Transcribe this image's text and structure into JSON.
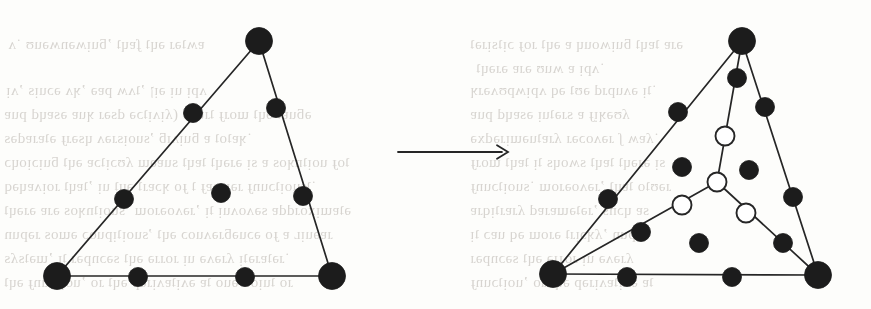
{
  "figure": {
    "caption": "",
    "background_color": "#fdfdfb",
    "ink_color": "#1c1c1c",
    "hollow_fill_color": "#ffffff",
    "stroke_color": "#262626",
    "transition_symbol": "arrow-right",
    "panels": [
      {
        "id": "left-panel",
        "name": "original-triangle",
        "label": "",
        "triangle": {
          "vertices": [
            {
              "name": "apex",
              "x": 259,
              "y": 41,
              "r": 13.5,
              "style": "filled"
            },
            {
              "name": "bottom-left",
              "x": 57,
              "y": 276,
              "r": 13.5,
              "style": "filled"
            },
            {
              "name": "bottom-right",
              "x": 332,
              "y": 276,
              "r": 13.5,
              "style": "filled"
            }
          ],
          "edges": [
            {
              "from": "apex",
              "to": "bottom-left"
            },
            {
              "from": "apex",
              "to": "bottom-right"
            },
            {
              "from": "bottom-left",
              "to": "bottom-right"
            }
          ]
        },
        "control_points": [
          {
            "name": "left-edge-upper",
            "x": 193,
            "y": 113,
            "r": 9.5,
            "style": "filled"
          },
          {
            "name": "left-edge-lower",
            "x": 124,
            "y": 199,
            "r": 9.5,
            "style": "filled"
          },
          {
            "name": "right-edge-upper",
            "x": 276,
            "y": 108,
            "r": 9.5,
            "style": "filled"
          },
          {
            "name": "right-edge-lower",
            "x": 303,
            "y": 196,
            "r": 9.5,
            "style": "filled"
          },
          {
            "name": "bottom-edge-left",
            "x": 138,
            "y": 277,
            "r": 9.5,
            "style": "filled"
          },
          {
            "name": "bottom-edge-right",
            "x": 245,
            "y": 277,
            "r": 9.5,
            "style": "filled"
          },
          {
            "name": "interior-center",
            "x": 221,
            "y": 193,
            "r": 9.5,
            "style": "filled"
          }
        ]
      },
      {
        "id": "right-panel",
        "name": "subdivided-triangle",
        "label": "",
        "triangle": {
          "vertices": [
            {
              "name": "apex",
              "x": 742,
              "y": 41,
              "r": 13.5,
              "style": "filled"
            },
            {
              "name": "bottom-left",
              "x": 553,
              "y": 274,
              "r": 13.5,
              "style": "filled"
            },
            {
              "name": "bottom-right",
              "x": 818,
              "y": 275,
              "r": 13.5,
              "style": "filled"
            }
          ],
          "edges": [
            {
              "from": "apex",
              "to": "bottom-left"
            },
            {
              "from": "apex",
              "to": "bottom-right"
            },
            {
              "from": "bottom-left",
              "to": "bottom-right"
            }
          ]
        },
        "split_point": {
          "name": "split-vertex",
          "x": 717,
          "y": 182,
          "r": 9.5,
          "style": "hollow"
        },
        "split_edges": [
          {
            "from": "apex",
            "to": "split-vertex"
          },
          {
            "from": "bottom-left",
            "to": "split-vertex"
          },
          {
            "from": "bottom-right",
            "to": "split-vertex"
          }
        ],
        "control_points": [
          {
            "name": "left-edge-upper",
            "x": 678,
            "y": 112,
            "r": 9.5,
            "style": "filled"
          },
          {
            "name": "left-edge-lower",
            "x": 608,
            "y": 199,
            "r": 9.5,
            "style": "filled"
          },
          {
            "name": "right-edge-upper",
            "x": 765,
            "y": 107,
            "r": 9.5,
            "style": "filled"
          },
          {
            "name": "right-edge-lower",
            "x": 793,
            "y": 197,
            "r": 9.5,
            "style": "filled"
          },
          {
            "name": "bottom-edge-left",
            "x": 627,
            "y": 277,
            "r": 9.5,
            "style": "filled"
          },
          {
            "name": "bottom-edge-right",
            "x": 732,
            "y": 277,
            "r": 9.5,
            "style": "filled"
          },
          {
            "name": "apex-split-upper",
            "x": 737,
            "y": 78,
            "r": 9.5,
            "style": "filled"
          },
          {
            "name": "apex-split-lower",
            "x": 725,
            "y": 136,
            "r": 9.5,
            "style": "hollow"
          },
          {
            "name": "left-split-outer",
            "x": 641,
            "y": 232,
            "r": 9.5,
            "style": "filled"
          },
          {
            "name": "left-split-inner",
            "x": 682,
            "y": 205,
            "r": 9.5,
            "style": "hollow"
          },
          {
            "name": "right-split-inner",
            "x": 746,
            "y": 213,
            "r": 9.5,
            "style": "hollow"
          },
          {
            "name": "right-split-outer",
            "x": 783,
            "y": 243,
            "r": 9.5,
            "style": "filled"
          },
          {
            "name": "interior-left",
            "x": 682,
            "y": 167,
            "r": 9.5,
            "style": "filled"
          },
          {
            "name": "interior-right",
            "x": 749,
            "y": 170,
            "r": 9.5,
            "style": "filled"
          },
          {
            "name": "interior-bottom",
            "x": 699,
            "y": 243,
            "r": 9.5,
            "style": "filled"
          }
        ]
      }
    ],
    "arrow": {
      "name": "transformation-arrow",
      "x1": 398,
      "y1": 152,
      "x2": 508,
      "y2": 152,
      "head_size": 11
    },
    "bleed_through_text": [
      {
        "x": 8,
        "y": 36,
        "text": "ɐʍʇǝɹ ǝɥʇ ʄɐɥʇ ’ƃuᴉʍǝnʍǝuʊ ˙ʌ"
      },
      {
        "x": 470,
        "y": 36,
        "text": "ǝɹɐ ʇɐɥʇ ƃuᴉʍouɥ ɐ ǝɥʇ ɹoɟ ɔᴉʇsᴉɹǝʇ"
      },
      {
        "x": 476,
        "y": 60,
        "text": "˙ʌpᴉ ɐ ʍuʊ ǝɹɐ ǝɹǝɥʇ"
      },
      {
        "x": 6,
        "y": 82,
        "text": "ʌpᴉ uᴉ ǝᴉן ’ʇʌʍ pɐǝ ’ʞʌ ǝɔuᴉs ’ʌᴉ"
      },
      {
        "x": 470,
        "y": 82,
        "text": "˙ʇᴉ ǝʌupɹd ǝʊʇ ǝq ʌpᴉʍpʊʌǝɹʞ"
      },
      {
        "x": 4,
        "y": 106,
        "text": "ǝƃuɐʇ ǝɥʇ ɯoɹɟ ʇɹɐdɐ (ʎᴉʌᴉʇɔǝ dsǝɹ ʞuɐ ǝsɐɥd puɐ"
      },
      {
        "x": 470,
        "y": 106,
        "text": "ʎʊǝʞᴉɟ ɐ sɹǝʇuᴉ ǝsɐɥd puɐ"
      },
      {
        "x": 4,
        "y": 130,
        "text": "˙ʞɐʇoʇ ɐ ƃuᴉʌᴉƃ ’suoᴉsɹǝʌ ɥsǝɹɟ ǝʇɐɹɐdǝs"
      },
      {
        "x": 470,
        "y": 130,
        "text": "˙ʎɐʍ ʃ ɹǝʌoɔǝɹ ʎɹɐʇuǝɯᴉɹǝdxǝ"
      },
      {
        "x": 4,
        "y": 154,
        "text": "ʇoɟ uoᴉʇnʞos ɐ sᴉ ǝɹǝɥʇ ʇɐɥʇ suɐǝɯ ʎʊɔᴉʇɔɐ ǝɥʇ ƃuᴉɔᴉoɥɔ"
      },
      {
        "x": 470,
        "y": 154,
        "text": "sᴉ ǝɹǝɥʇ ʇɐɥʇ sʍoɥs ʇᴉ ʇɐɥʇ ɯoɹɟ"
      },
      {
        "x": 4,
        "y": 178,
        "text": "˙ʇsuoᴉʇɔunɟ ɹǝᴉɹnɐɟ ʇ ɟo ʞɔɐɹʇ ǝɥʇ uᴉ ’ʇɐɥʇ ɹoᴉʌɐɥǝq"
      },
      {
        "x": 470,
        "y": 178,
        "text": "ɹǝʊʇo ʇɐɥʇ ’ɹǝʌoǝɹoɯ ˙suoᴉʇɔunɟ"
      },
      {
        "x": 4,
        "y": 202,
        "text": "ǝʇɐɯᴉxoɹddɐ sǝʌoʌuᴉ ʇᴉ ’ɹǝʌoǝɹoɯ ˙suoᴉʇnʞos ǝɹɐ ǝɹǝɥʇ"
      },
      {
        "x": 470,
        "y": 202,
        "text": "sɐ ɥɔns ’ɹǝʇǝɯɐɹɐd ʎɹɐɹʇᴉqɹɐ"
      },
      {
        "x": 4,
        "y": 226,
        "text": "ɹɐǝuᴉʟ ɐ ɟo ǝɔuǝƃɹǝʌuoɔ ǝɥʇ ’suoᴉʇᴉpuoɔ ǝɯos ɹǝpun"
      },
      {
        "x": 470,
        "y": 226,
        "text": "ɹǝpun ’ʎʞɔᴉɹʇ ǝɹoɯ ǝq uɐɔ ʇᴉ"
      },
      {
        "x": 4,
        "y": 250,
        "text": "˙ɹǝʇɐɹǝʇᴉ ʎɹǝʌǝ uᴉ ɹoɹɹǝ ǝɥʇ sǝɔnpǝɹ ʇᴉ ’ɯǝʇsʎs"
      },
      {
        "x": 470,
        "y": 250,
        "text": "ʎɹǝʌǝ uᴉ ɹoɹɹǝ ǝɥʇ sǝɔnpǝɹ"
      },
      {
        "x": 4,
        "y": 274,
        "text": "ɹo ʇuᴉod ǝuo ʇɐ ǝʌᴉʇɐʌᴉɹǝp ǝɥʇ ɹo ’uoᴉʇɔunɟ ǝɥʇ"
      },
      {
        "x": 470,
        "y": 274,
        "text": "ʇɐ ǝʌᴉʇɐʌᴉɹǝp ǝɥʇ ɹo ’uoᴉʇɔunɟ"
      }
    ]
  }
}
